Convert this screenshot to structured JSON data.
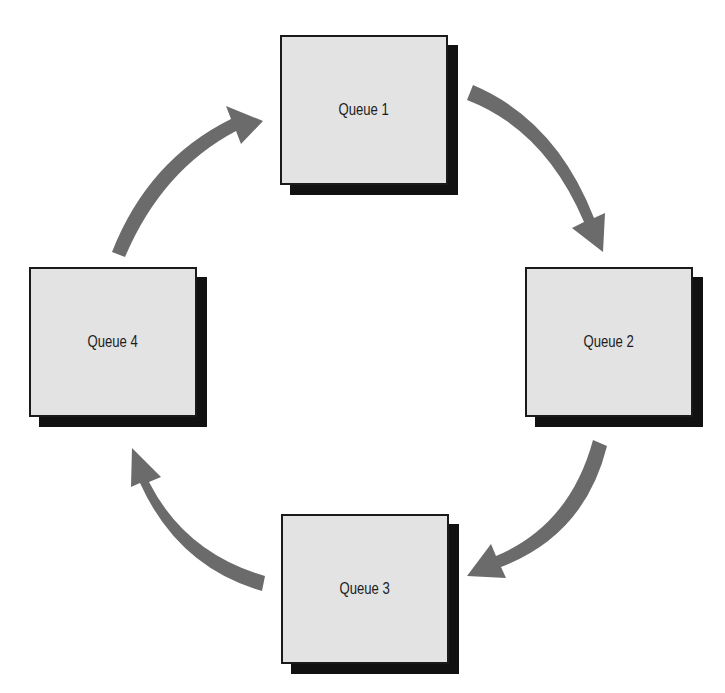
{
  "diagram": {
    "type": "cycle",
    "colors": {
      "box_fill": "#e3e3e3",
      "box_border": "#1a1a1a",
      "box_shadow": "#111111",
      "arrow": "#6b6b6b",
      "background": "#ffffff"
    },
    "nodes": [
      {
        "id": "queue-1",
        "label": "Queue 1",
        "x": 280,
        "y": 35
      },
      {
        "id": "queue-2",
        "label": "Queue 2",
        "x": 525,
        "y": 267
      },
      {
        "id": "queue-3",
        "label": "Queue 3",
        "x": 281,
        "y": 514
      },
      {
        "id": "queue-4",
        "label": "Queue 4",
        "x": 29,
        "y": 267
      }
    ],
    "edges": [
      {
        "from": "queue-1",
        "to": "queue-2"
      },
      {
        "from": "queue-2",
        "to": "queue-3"
      },
      {
        "from": "queue-3",
        "to": "queue-4"
      },
      {
        "from": "queue-4",
        "to": "queue-1"
      }
    ]
  }
}
